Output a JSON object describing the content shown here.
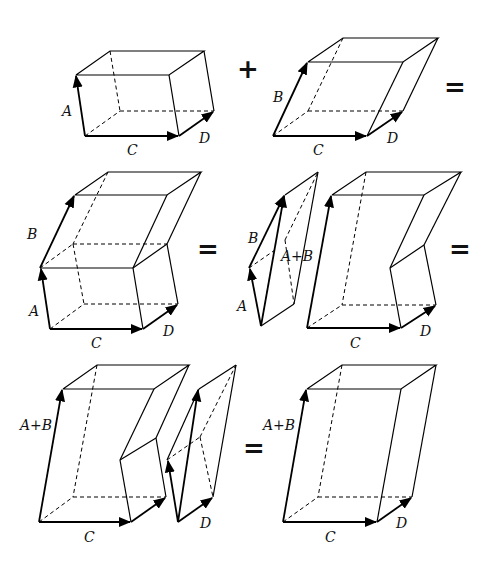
{
  "operators": {
    "plus": "+",
    "equals": "="
  },
  "labels": {
    "A": "A",
    "B": "B",
    "C": "C",
    "D": "D",
    "AplusB": "A+B"
  },
  "rows": [
    {
      "name": "row-1",
      "description": "Box(A,C,D) + Box(B,C,D) ="
    },
    {
      "name": "row-2",
      "description": "Stacked boxes = wedge + notched solid ="
    },
    {
      "name": "row-3",
      "description": "Notched solid + wedge = Box(A+B,C,D)"
    }
  ]
}
